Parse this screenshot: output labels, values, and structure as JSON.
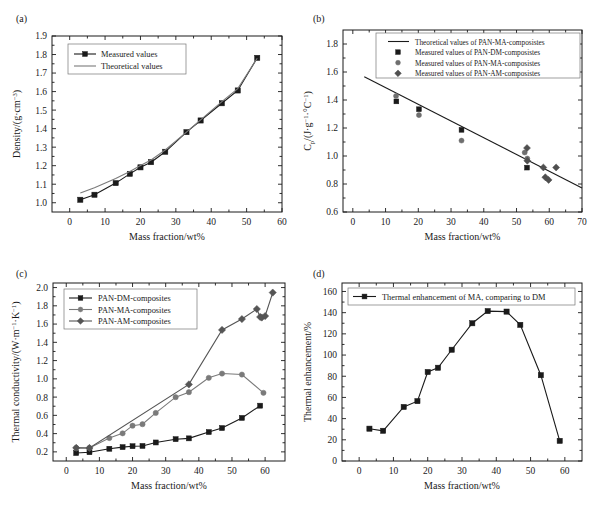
{
  "figure": {
    "panels": [
      "a",
      "b",
      "c",
      "d"
    ]
  },
  "colors": {
    "black": "#1a1a1a",
    "gray": "#7a7a7a",
    "dark_gray": "#555555",
    "frame": "#1a1a1a",
    "background": "#ffffff"
  },
  "panel_a": {
    "label": "(a)",
    "chart_data": {
      "type": "line",
      "title": "",
      "xlabel": "Mass fraction/wt%",
      "ylabel": "Density/(g·cm⁻³)",
      "ylabel_parts": {
        "main": "Density/(g·cm",
        "sup": "−3",
        "tail": ")"
      },
      "xlim": [
        -5,
        60
      ],
      "ylim": [
        0.95,
        1.9
      ],
      "xticks": [
        0,
        10,
        20,
        30,
        40,
        50,
        60
      ],
      "yticks": [
        1.0,
        1.1,
        1.2,
        1.3,
        1.4,
        1.5,
        1.6,
        1.7,
        1.8,
        1.9
      ],
      "ytick_labels": [
        "1.0",
        "1.1",
        "1.2",
        "1.3",
        "1.4",
        "1.5",
        "1.6",
        "1.7",
        "1.8",
        "1.9"
      ],
      "grid": false,
      "legend_position": "upper-left",
      "series": [
        {
          "name": "Measured values",
          "marker": "square",
          "color": "#1a1a1a",
          "x": [
            3.0,
            7.0,
            13.0,
            17.0,
            20.0,
            23.0,
            27.0,
            33.0,
            37.0,
            43.0,
            47.5,
            53.0
          ],
          "values": [
            1.016,
            1.043,
            1.106,
            1.156,
            1.191,
            1.219,
            1.275,
            1.381,
            1.444,
            1.537,
            1.606,
            1.782
          ]
        },
        {
          "name": "Theoretical values",
          "marker": "none",
          "color": "#7a7a7a",
          "x": [
            3.0,
            7.0,
            13.0,
            17.0,
            20.0,
            23.0,
            27.0,
            33.0,
            37.0,
            43.0,
            47.5,
            53.0
          ],
          "values": [
            1.052,
            1.081,
            1.131,
            1.169,
            1.201,
            1.231,
            1.285,
            1.381,
            1.447,
            1.546,
            1.616,
            1.78
          ]
        }
      ]
    }
  },
  "panel_b": {
    "label": "(b)",
    "chart_data": {
      "type": "scatter",
      "title": "",
      "xlabel": "Mass fraction/wt%",
      "ylabel": "C_p/(J·g⁻¹·°C⁻¹)",
      "ylabel_parts": {
        "c": "C",
        "sub": "p",
        "mid": "/(J·g",
        "sup1": "−1",
        "mid2": "·°C",
        "sup2": "−1",
        "tail": ")"
      },
      "xlim": [
        -3,
        70
      ],
      "ylim": [
        0.6,
        1.9
      ],
      "xticks": [
        0,
        10,
        20,
        30,
        40,
        50,
        60,
        70
      ],
      "yticks": [
        0.6,
        0.8,
        1.0,
        1.2,
        1.4,
        1.6,
        1.8
      ],
      "ytick_labels": [
        "0.6",
        "0.8",
        "1.0",
        "1.2",
        "1.4",
        "1.6",
        "1.8"
      ],
      "grid": false,
      "legend_position": "upper-right",
      "series": [
        {
          "name": "Theoretical values of PAN-MA-composistes",
          "marker": "line",
          "color": "#1a1a1a",
          "x": [
            3.5,
            70.0
          ],
          "values": [
            1.566,
            0.772
          ]
        },
        {
          "name": "Measured values of PAN-DM-composistes",
          "marker": "square",
          "color": "#1a1a1a",
          "x": [
            13.3,
            20.2,
            33.2,
            53.2
          ],
          "values": [
            1.39,
            1.334,
            1.187,
            0.917
          ]
        },
        {
          "name": "Measured values of PAN-MA-composistes",
          "marker": "circle",
          "color": "#6e6e6e",
          "x": [
            13.2,
            20.2,
            33.2,
            52.5,
            53.3
          ],
          "values": [
            1.429,
            1.292,
            1.11,
            1.025,
            0.982
          ]
        },
        {
          "name": "Measured values of PAN-AM-composistes",
          "marker": "diamond",
          "color": "#4f4f4f",
          "x": [
            53.2,
            53.3,
            58.2,
            58.8,
            59.8,
            62.1
          ],
          "values": [
            1.057,
            0.966,
            0.918,
            0.848,
            0.829,
            0.918
          ]
        }
      ]
    }
  },
  "panel_c": {
    "label": "(c)",
    "chart_data": {
      "type": "line",
      "title": "",
      "xlabel": "Mass fraction/wt%",
      "ylabel": "Thermal conductivity/(W·m⁻¹·K⁻¹)",
      "ylabel_parts": {
        "main": "Thermal conductivity/(W·m",
        "sup1": "−1",
        "mid": "·K",
        "sup2": "−1",
        "tail": ")"
      },
      "xlim": [
        -4,
        66
      ],
      "ylim": [
        0.1,
        2.05
      ],
      "xticks": [
        0,
        10,
        20,
        30,
        40,
        50,
        60
      ],
      "yticks": [
        0.2,
        0.4,
        0.6,
        0.8,
        1.0,
        1.2,
        1.4,
        1.6,
        1.8,
        2.0
      ],
      "ytick_labels": [
        "0.2",
        "0.4",
        "0.6",
        "0.8",
        "1.0",
        "1.2",
        "1.4",
        "1.6",
        "1.8",
        "2.0"
      ],
      "grid": false,
      "legend_position": "upper-left",
      "series": [
        {
          "name": "PAN-DM-composites",
          "marker": "square",
          "color": "#1a1a1a",
          "x": [
            3.0,
            7.0,
            13.0,
            17.0,
            20.0,
            23.0,
            27.0,
            33.0,
            37.0,
            43.0,
            47.0,
            53.0,
            58.5
          ],
          "values": [
            0.187,
            0.196,
            0.234,
            0.252,
            0.262,
            0.265,
            0.303,
            0.339,
            0.348,
            0.417,
            0.461,
            0.572,
            0.706
          ]
        },
        {
          "name": "PAN-MA-composites",
          "marker": "circle",
          "color": "#7a7a7a",
          "x": [
            3.0,
            7.0,
            13.0,
            17.0,
            20.0,
            23.0,
            27.0,
            33.0,
            37.0,
            43.0,
            47.0,
            53.0,
            59.5
          ],
          "values": [
            0.244,
            0.243,
            0.351,
            0.403,
            0.487,
            0.503,
            0.627,
            0.799,
            0.854,
            1.011,
            1.058,
            1.047,
            0.847
          ]
        },
        {
          "name": "PAN-AM-composites",
          "marker": "diamond",
          "color": "#555555",
          "x": [
            3.0,
            7.0,
            37.0,
            47.0,
            53.0,
            57.5,
            58.5,
            59.0,
            60.0,
            62.3
          ],
          "values": [
            0.244,
            0.243,
            0.939,
            1.536,
            1.655,
            1.765,
            1.678,
            1.672,
            1.688,
            1.945
          ]
        }
      ]
    }
  },
  "panel_d": {
    "label": "(d)",
    "chart_data": {
      "type": "line",
      "title": "",
      "xlabel": "Mass fraction/wt%",
      "ylabel": "Thermal enhancement/%",
      "xlim": [
        -5,
        65
      ],
      "ylim": [
        0,
        168
      ],
      "xticks": [
        0,
        10,
        20,
        30,
        40,
        50,
        60
      ],
      "yticks": [
        0,
        20,
        40,
        60,
        80,
        100,
        120,
        140,
        160
      ],
      "ytick_labels": [
        "0",
        "20",
        "40",
        "60",
        "80",
        "100",
        "120",
        "140",
        "160"
      ],
      "grid": false,
      "legend_position": "upper-left",
      "series": [
        {
          "name": "Thermal enhancement of MA, comparing to DM",
          "marker": "square",
          "color": "#1a1a1a",
          "x": [
            3.0,
            7.0,
            13.0,
            17.0,
            20.0,
            23.0,
            27.0,
            33.0,
            37.5,
            43.0,
            47.0,
            53.0,
            58.5
          ],
          "values": [
            30.5,
            28.5,
            51.0,
            56.5,
            84.0,
            88.0,
            105.0,
            130.0,
            141.5,
            141.0,
            128.5,
            81.0,
            19.0
          ]
        }
      ]
    }
  }
}
